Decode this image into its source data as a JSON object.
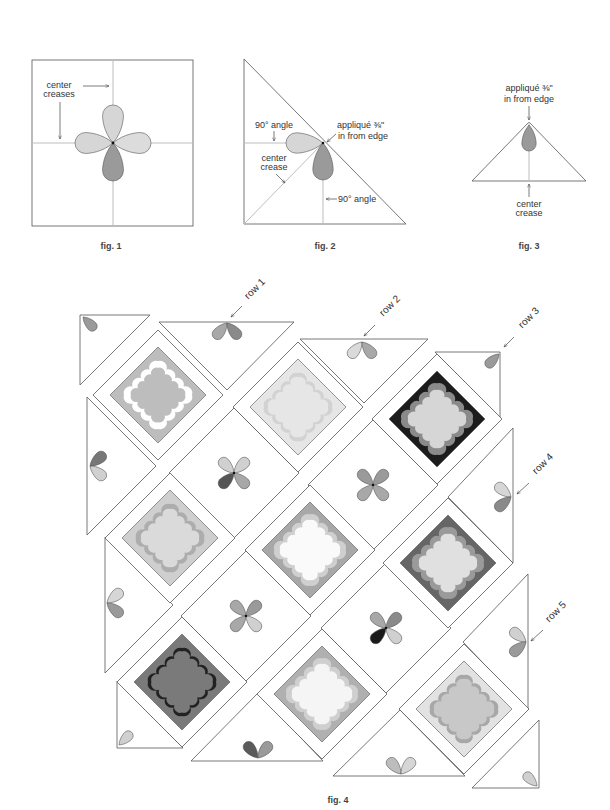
{
  "figures": {
    "fig1": {
      "caption": "fig. 1",
      "label_center_creases": [
        "center",
        "creases"
      ],
      "petal_colors": {
        "top": "#d6d6d6",
        "right": "#dcdcdc",
        "bottom": "#9a9a9a",
        "left": "#d6d6d6"
      }
    },
    "fig2": {
      "caption": "fig. 2",
      "label_angle_top": "90° angle",
      "label_applique": [
        "appliqué ⅜\"",
        "in from edge"
      ],
      "label_center_crease": [
        "center",
        "crease"
      ],
      "label_angle_bottom": "90° angle",
      "petal_colors": {
        "left": "#d6d6d6",
        "bottom": "#9a9a9a"
      }
    },
    "fig3": {
      "caption": "fig. 3",
      "label_applique": [
        "appliqué ⅜\"",
        "in from edge"
      ],
      "label_center_crease": [
        "center",
        "crease"
      ],
      "petal_colors": {
        "bottom": "#9a9a9a"
      }
    },
    "fig4": {
      "caption": "fig. 4",
      "row_labels": [
        "row 1",
        "row 2",
        "row 3",
        "row 4",
        "row 5"
      ],
      "framed_blocks": {
        "a": {
          "background": "#bdbdbd",
          "ring": "#ffffff",
          "center": "#bdbdbd"
        },
        "b": {
          "background": "#e6e6e6",
          "ring": "#d2d2d2",
          "center": "#e6e6e6"
        },
        "c": {
          "background": "#1c1c1c",
          "ring": "#8a8a8a",
          "center": "#d6d6d6"
        },
        "d": {
          "background": "#cfcfcf",
          "ring": "#adadad",
          "center": "#dadada"
        },
        "e": {
          "background": "#a8a8a8",
          "ring": "#cfcfcf",
          "center": "#fafafa"
        },
        "f": {
          "background": "#666666",
          "ring": "#9a9a9a",
          "center": "#e0e0e0"
        },
        "g": {
          "background": "#7a7a7a",
          "ring": "#222222",
          "center": "#7a7a7a"
        },
        "h": {
          "background": "#b0b0b0",
          "ring": "#cfcfcf",
          "center": "#f5f5f5"
        },
        "i": {
          "background": "#e2e2e2",
          "ring": "#a8a8a8",
          "center": "#c8c8c8"
        }
      },
      "plain_blocks": {
        "row2": {
          "petals": [
            "#d0d0d0",
            "#d0d0d0",
            "#555555",
            "#a8a8a8"
          ]
        },
        "row3_left": {
          "petals": [
            "#a8a8a8",
            "#9a9a9a",
            "#a8a8a8",
            "#d0d0d0"
          ]
        },
        "row3_right": {
          "petals": [
            "#9a9a9a",
            "#9a9a9a",
            "#a8a8a8",
            "#a8a8a8"
          ]
        },
        "row4": {
          "petals": [
            "#a8a8a8",
            "#8a8a8a",
            "#1a1a1a",
            "#d0d0d0"
          ]
        }
      },
      "setting_triangles": {
        "corner_top_left": {
          "petals": [
            "#9a9a9a"
          ]
        },
        "top_row1": {
          "petals": [
            "#a8a8a8",
            "#8a8a8a"
          ]
        },
        "top_row2": {
          "petals": [
            "#dadada",
            "#a8a8a8"
          ]
        },
        "corner_top_right": {
          "petals": [
            "#9a9a9a"
          ]
        },
        "right_row4": {
          "petals": [
            "#d6d6d6",
            "#8a8a8a"
          ]
        },
        "right_row5": {
          "petals": [
            "#d0d0d0",
            "#9a9a9a"
          ]
        },
        "corner_bottom_right": {
          "petals": [
            "#d0d0d0"
          ]
        },
        "bottom_row5": {
          "petals": [
            "#bdbdbd",
            "#d6d6d6"
          ]
        },
        "bottom_row4": {
          "petals": [
            "#5a5a5a",
            "#9a9a9a"
          ]
        },
        "corner_bottom_left": {
          "petals": [
            "#d0d0d0"
          ]
        },
        "left_row2": {
          "petals": [
            "#d6d6d6",
            "#9a9a9a"
          ]
        },
        "left_row1": {
          "petals": [
            "#777777",
            "#d0d0d0"
          ]
        }
      }
    }
  }
}
